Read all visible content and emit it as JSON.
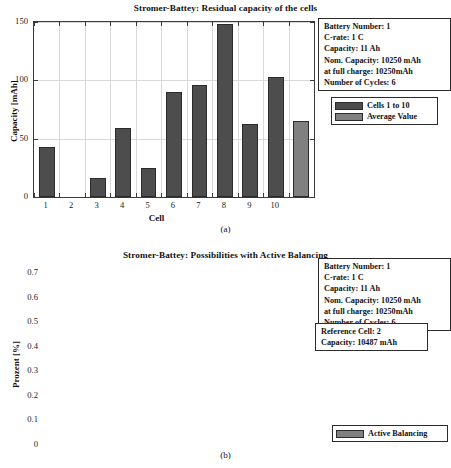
{
  "figure_a": {
    "title": "Stromer-Battey: Residual capacity of the cells",
    "caption": "(a)",
    "xlabel": "Cell",
    "ylabel": "Capacity [mAh]",
    "yticks": [
      "0",
      "50",
      "100",
      "150"
    ],
    "xticks": [
      "1",
      "2",
      "3",
      "4",
      "5",
      "6",
      "7",
      "8",
      "9",
      "10"
    ],
    "info": {
      "battery_number": "Battery Number: 1",
      "c_rate": "C-rate: 1 C",
      "capacity": "Capacity: 11 Ah",
      "nom_capacity": "Nom. Capacity: 10250 mAh",
      "at_full_charge": "at full charge: 10250mAh",
      "cycles": "Number of Cycles: 6"
    },
    "legend": [
      {
        "label": "Cells 1 to 10",
        "color": "#4d4d4d"
      },
      {
        "label": "Average Value",
        "color": "#808080"
      }
    ]
  },
  "figure_b": {
    "title": "Stromer-Battey: Possibilities with Active Balancing",
    "caption": "(b)",
    "ylabel": "Prozent [%]",
    "yticks": [
      "0",
      "0.1",
      "0.2",
      "0.3",
      "0.4",
      "0.5",
      "0.6",
      "0.7"
    ],
    "info": {
      "battery_number": "Battery Number: 1",
      "c_rate": "C-rate: 1 C",
      "capacity": "Capacity: 11 Ah",
      "nom_capacity": "Nom. Capacity: 10250 mAh",
      "at_full_charge": "at full charge: 10250mAh",
      "cycles": "Number of Cycles: 6"
    },
    "reference": {
      "reference_cell": "Reference Cell: 2",
      "capacity": "Capacity: 10487 mAh"
    },
    "legend": [
      {
        "label": "Active Balancing",
        "color": "#808080"
      }
    ]
  },
  "chart_data": [
    {
      "type": "bar",
      "title": "Stromer-Battey: Residual capacity of the cells",
      "xlabel": "Cell",
      "ylabel": "Capacity [mAh]",
      "categories": [
        "1",
        "2",
        "3",
        "4",
        "5",
        "6",
        "7",
        "8",
        "9",
        "10",
        "Average"
      ],
      "values": [
        43,
        0,
        16,
        59,
        25,
        90,
        96,
        148,
        63,
        103,
        65
      ],
      "ylim": [
        0,
        150
      ],
      "yticks": [
        0,
        50,
        100,
        150
      ],
      "grid": true,
      "legend_position": "top-right",
      "series": [
        {
          "name": "Cells 1 to 10",
          "color": "#4d4d4d",
          "values": [
            43,
            0,
            16,
            59,
            25,
            90,
            96,
            148,
            63,
            103
          ]
        },
        {
          "name": "Average Value",
          "color": "#808080",
          "values": [
            65
          ]
        }
      ]
    },
    {
      "type": "bar",
      "title": "Stromer-Battey: Possibilities with Active Balancing",
      "xlabel": "",
      "ylabel": "Prozent [%]",
      "categories": [
        "Active Balancing"
      ],
      "values": [
        0.61
      ],
      "ylim": [
        0,
        0.7
      ],
      "yticks": [
        0,
        0.1,
        0.2,
        0.3,
        0.4,
        0.5,
        0.6,
        0.7
      ],
      "grid": true,
      "legend_position": "bottom-right",
      "series": [
        {
          "name": "Active Balancing",
          "color": "#808080",
          "values": [
            0.61
          ]
        }
      ]
    }
  ]
}
